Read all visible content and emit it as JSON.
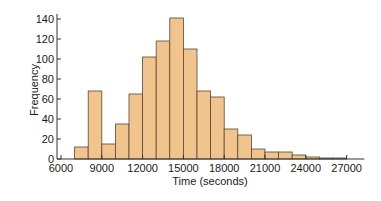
{
  "chart_data": {
    "type": "bar",
    "title": "",
    "xlabel": "Time (seconds)",
    "ylabel": "Frequency",
    "bin_width": 1000,
    "bin_edges": [
      7000,
      8000,
      9000,
      10000,
      11000,
      12000,
      13000,
      14000,
      15000,
      16000,
      17000,
      18000,
      19000,
      20000,
      21000,
      22000,
      23000,
      24000,
      25000,
      26000,
      27000
    ],
    "values": [
      12,
      68,
      15,
      35,
      65,
      102,
      118,
      141,
      110,
      68,
      62,
      30,
      24,
      10,
      7,
      7,
      4,
      2,
      1,
      1
    ],
    "xlim": [
      6000,
      28300
    ],
    "ylim": [
      0,
      145
    ],
    "x_ticks": [
      6000,
      9000,
      12000,
      15000,
      18000,
      21000,
      24000,
      27000
    ],
    "x_tick_labels": [
      "6000",
      "9000",
      "12000",
      "15000",
      "18000",
      "21000",
      "24000",
      "27000"
    ],
    "y_ticks": [
      0,
      20,
      40,
      60,
      80,
      100,
      120,
      140
    ],
    "y_tick_labels": [
      "0",
      "20",
      "40",
      "60",
      "80",
      "100",
      "120",
      "140"
    ],
    "grid": false,
    "legend": null,
    "colors": {
      "bar_fill": "#f2c48d",
      "bar_edge": "#5a4632",
      "axis": "#333333"
    }
  }
}
